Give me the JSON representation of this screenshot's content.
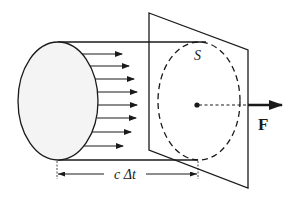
{
  "diagram": {
    "labels": {
      "surface": "S",
      "force": "F",
      "distance": "c Δt"
    },
    "arrow_count": 8,
    "colors": {
      "stroke": "#1a1a1a",
      "fill": "#f4f4f4",
      "background": "#ffffff"
    }
  }
}
